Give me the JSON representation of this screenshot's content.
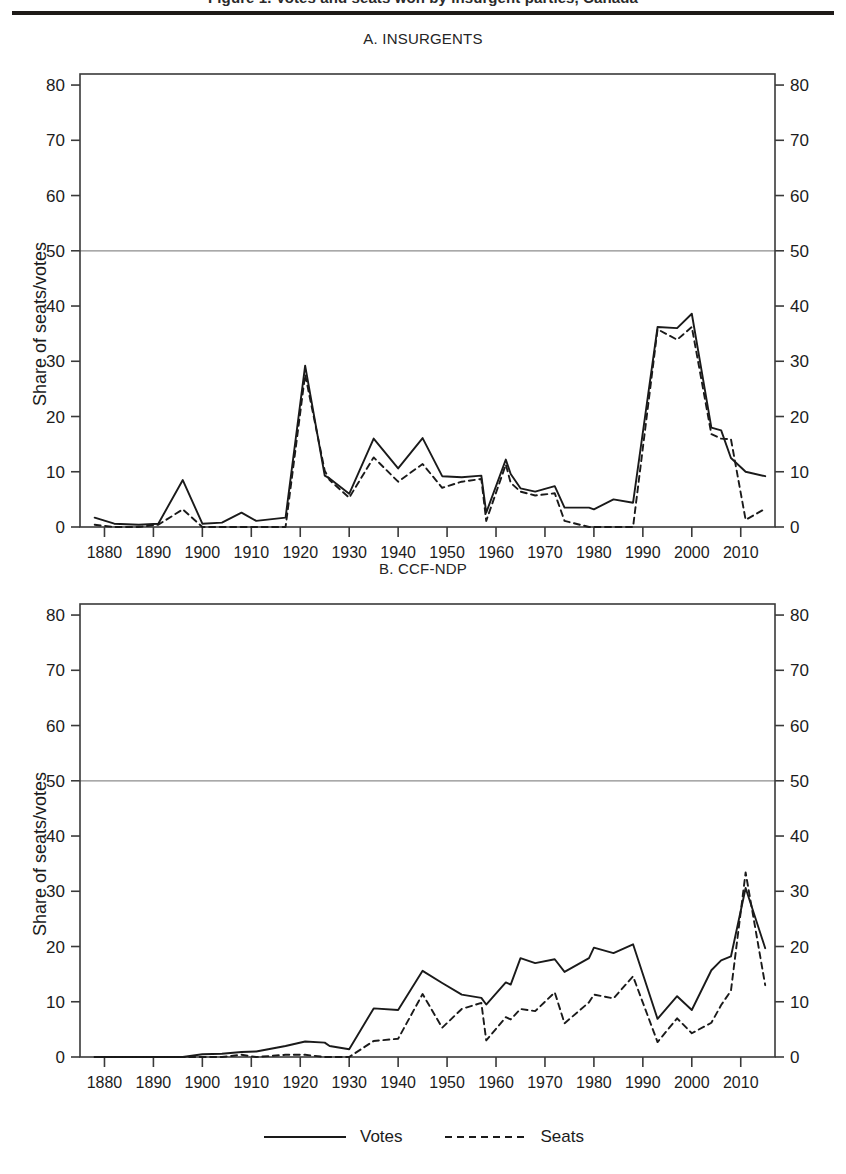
{
  "figure": {
    "caption_partial": "Figure 1. Votes and seats won by insurgent parties, Canada",
    "legend": [
      {
        "key": "votes",
        "label": "Votes",
        "style": "solid"
      },
      {
        "key": "seats",
        "label": "Seats",
        "style": "dashed"
      }
    ]
  },
  "chart_data": [
    {
      "type": "line",
      "panel": "A",
      "title": "A. INSURGENTS",
      "xlabel": "",
      "ylabel": "Share of seats/votes",
      "xlim": [
        1875,
        2017
      ],
      "ylim": [
        0,
        82
      ],
      "yticks": [
        0,
        10,
        20,
        30,
        40,
        50,
        60,
        70,
        80
      ],
      "xticks": [
        1880,
        1890,
        1900,
        1910,
        1920,
        1930,
        1940,
        1950,
        1960,
        1970,
        1980,
        1990,
        2000,
        2010
      ],
      "grid": false,
      "reference_line": {
        "y": 50,
        "style": "solid-grey"
      },
      "legend_position": "below-figure",
      "x": [
        1878,
        1882,
        1887,
        1891,
        1896,
        1900,
        1904,
        1908,
        1911,
        1917,
        1921,
        1925,
        1926,
        1930,
        1935,
        1940,
        1945,
        1949,
        1953,
        1957,
        1958,
        1962,
        1963,
        1965,
        1968,
        1972,
        1974,
        1979,
        1980,
        1984,
        1988,
        1993,
        1997,
        2000,
        2004,
        2006,
        2008,
        2011,
        2015
      ],
      "series": [
        {
          "name": "Votes",
          "style": "solid",
          "values": [
            1.7,
            0.6,
            0.4,
            0.6,
            8.5,
            0.6,
            0.8,
            2.6,
            1.1,
            1.7,
            29.2,
            9.3,
            8.8,
            6.0,
            16.0,
            10.6,
            16.1,
            9.2,
            9.0,
            9.3,
            2.6,
            12.2,
            9.6,
            7.0,
            6.4,
            7.4,
            3.5,
            3.5,
            3.2,
            5.0,
            4.4,
            36.2,
            36.0,
            38.6,
            18.0,
            17.5,
            12.5,
            10.0,
            9.2
          ]
        },
        {
          "name": "Seats",
          "style": "dashed",
          "values": [
            0.4,
            0.0,
            0.0,
            0.4,
            3.2,
            0.0,
            0.0,
            0.0,
            0.0,
            0.0,
            27.6,
            10.2,
            8.5,
            5.3,
            12.6,
            8.2,
            11.4,
            7.1,
            8.2,
            8.7,
            1.1,
            11.3,
            8.0,
            6.4,
            5.7,
            6.1,
            1.1,
            0.0,
            0.0,
            0.0,
            0.0,
            35.8,
            33.9,
            36.2,
            16.8,
            16.0,
            15.9,
            1.3,
            3.3
          ]
        }
      ]
    },
    {
      "type": "line",
      "panel": "B",
      "title": "B. CCF-NDP",
      "xlabel": "",
      "ylabel": "Share of seats/votes",
      "xlim": [
        1875,
        2017
      ],
      "ylim": [
        0,
        82
      ],
      "yticks": [
        0,
        10,
        20,
        30,
        40,
        50,
        60,
        70,
        80
      ],
      "xticks": [
        1880,
        1890,
        1900,
        1910,
        1920,
        1930,
        1940,
        1950,
        1960,
        1970,
        1980,
        1990,
        2000,
        2010
      ],
      "grid": false,
      "reference_line": {
        "y": 50,
        "style": "solid-grey"
      },
      "legend_position": "below-figure",
      "x": [
        1878,
        1882,
        1887,
        1891,
        1896,
        1900,
        1904,
        1908,
        1911,
        1917,
        1921,
        1925,
        1926,
        1930,
        1935,
        1940,
        1945,
        1949,
        1953,
        1957,
        1958,
        1962,
        1963,
        1965,
        1968,
        1972,
        1974,
        1979,
        1980,
        1984,
        1988,
        1993,
        1997,
        2000,
        2004,
        2006,
        2008,
        2011,
        2015
      ],
      "series": [
        {
          "name": "Votes",
          "style": "solid",
          "values": [
            0.0,
            0.0,
            0.0,
            0.0,
            0.0,
            0.5,
            0.6,
            0.9,
            1.0,
            2.0,
            2.8,
            2.6,
            2.0,
            1.4,
            8.8,
            8.5,
            15.6,
            13.4,
            11.3,
            10.7,
            9.5,
            13.5,
            13.1,
            17.9,
            17.0,
            17.7,
            15.4,
            17.9,
            19.8,
            18.8,
            20.4,
            6.9,
            11.0,
            8.5,
            15.7,
            17.5,
            18.2,
            30.6,
            19.7
          ]
        },
        {
          "name": "Seats",
          "style": "dashed",
          "values": [
            0.0,
            0.0,
            0.0,
            0.0,
            0.0,
            0.0,
            0.0,
            0.4,
            0.0,
            0.4,
            0.4,
            0.0,
            0.0,
            0.0,
            2.9,
            3.3,
            11.4,
            5.3,
            8.7,
            9.8,
            3.0,
            7.2,
            6.8,
            8.7,
            8.3,
            11.7,
            6.1,
            9.9,
            11.3,
            10.6,
            14.6,
            2.7,
            7.0,
            4.3,
            6.2,
            9.4,
            12.0,
            33.4,
            13.0
          ]
        }
      ]
    }
  ]
}
